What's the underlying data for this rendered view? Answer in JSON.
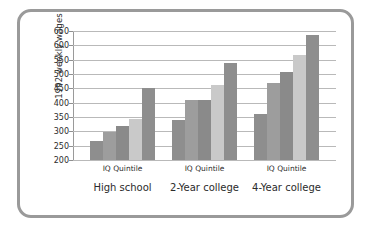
{
  "chart_data": {
    "type": "bar",
    "title": "",
    "subtitle": "",
    "xlabel": "",
    "ylabel": "1992 weekly wages",
    "ylim": [
      200,
      650
    ],
    "yticks": [
      200,
      250,
      300,
      350,
      400,
      450,
      500,
      550,
      600,
      650
    ],
    "grid": true,
    "legend": "none",
    "group_sublabel": "IQ Quintile",
    "categories": [
      "High school",
      "2-Year college",
      "4-Year college"
    ],
    "series": [
      {
        "name": "1st quintile",
        "values": [
          265,
          338,
          362
        ]
      },
      {
        "name": "2nd quintile",
        "values": [
          297,
          410,
          470
        ]
      },
      {
        "name": "3rd quintile",
        "values": [
          320,
          411,
          508
        ]
      },
      {
        "name": "4th quintile",
        "values": [
          342,
          463,
          565
        ]
      },
      {
        "name": "5th quintile",
        "values": [
          450,
          537,
          637
        ]
      }
    ],
    "groups": [
      {
        "label": "High school",
        "sublabel": "IQ Quintile",
        "values": [
          265,
          297,
          320,
          342,
          450
        ]
      },
      {
        "label": "2-Year college",
        "sublabel": "IQ Quintile",
        "values": [
          338,
          410,
          411,
          463,
          537
        ]
      },
      {
        "label": "4-Year college",
        "sublabel": "IQ Quintile",
        "values": [
          362,
          470,
          508,
          565,
          637
        ]
      }
    ],
    "colors": {
      "bar_1": "#8e8e8e",
      "bar_2": "#9d9d9d",
      "bar_3": "#8a8a8a",
      "bar_4": "#c9c9c9",
      "bar_5": "#8e8e8e",
      "gridline": "#b9b9b9",
      "frame_border": "#9a9a9a",
      "text": "#2b2b2b",
      "background": "#ffffff"
    }
  }
}
